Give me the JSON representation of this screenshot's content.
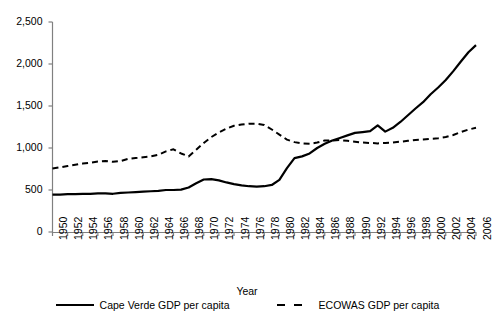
{
  "chart_data": {
    "type": "line",
    "title": "",
    "xlabel": "Year",
    "ylabel": "",
    "xlim": [
      1950,
      2006
    ],
    "ylim": [
      0,
      2500
    ],
    "grid": false,
    "legend_position": "bottom",
    "x_tick_labels": [
      "1950",
      "1952",
      "1954",
      "1956",
      "1958",
      "1960",
      "1962",
      "1964",
      "1966",
      "1968",
      "1970",
      "1972",
      "1974",
      "1976",
      "1978",
      "1980",
      "1982",
      "1984",
      "1986",
      "1988",
      "1990",
      "1992",
      "1994",
      "1996",
      "1998",
      "2000",
      "2002",
      "2004",
      "2006"
    ],
    "y_tick_labels": [
      "0",
      "500",
      "1,000",
      "1,500",
      "2,000",
      "2,500"
    ],
    "y_tick_values": [
      0,
      500,
      1000,
      1500,
      2000,
      2500
    ],
    "x": [
      1950,
      1951,
      1952,
      1953,
      1954,
      1955,
      1956,
      1957,
      1958,
      1959,
      1960,
      1961,
      1962,
      1963,
      1964,
      1965,
      1966,
      1967,
      1968,
      1969,
      1970,
      1971,
      1972,
      1973,
      1974,
      1975,
      1976,
      1977,
      1978,
      1979,
      1980,
      1981,
      1982,
      1983,
      1984,
      1985,
      1986,
      1987,
      1988,
      1989,
      1990,
      1991,
      1992,
      1993,
      1994,
      1995,
      1996,
      1997,
      1998,
      1999,
      2000,
      2001,
      2002,
      2003,
      2004,
      2005,
      2006
    ],
    "series": [
      {
        "name": "Cape Verde GDP per capita",
        "style": "solid",
        "color": "#000000",
        "values": [
          445,
          445,
          450,
          450,
          455,
          455,
          460,
          460,
          455,
          465,
          470,
          475,
          480,
          485,
          490,
          500,
          500,
          505,
          530,
          580,
          625,
          630,
          615,
          590,
          570,
          555,
          545,
          540,
          545,
          560,
          620,
          760,
          880,
          900,
          935,
          1000,
          1050,
          1090,
          1120,
          1150,
          1180,
          1190,
          1200,
          1270,
          1195,
          1240,
          1310,
          1390,
          1470,
          1545,
          1640,
          1720,
          1810,
          1915,
          2030,
          2140,
          2225
        ]
      },
      {
        "name": "ECOWAS GDP per capita",
        "style": "dashed",
        "color": "#000000",
        "values": [
          755,
          770,
          785,
          800,
          815,
          825,
          840,
          845,
          835,
          845,
          870,
          880,
          890,
          900,
          920,
          960,
          985,
          935,
          900,
          980,
          1060,
          1130,
          1185,
          1230,
          1265,
          1280,
          1290,
          1290,
          1275,
          1220,
          1160,
          1100,
          1070,
          1055,
          1050,
          1065,
          1090,
          1090,
          1095,
          1085,
          1075,
          1065,
          1060,
          1055,
          1060,
          1065,
          1075,
          1085,
          1095,
          1100,
          1110,
          1115,
          1130,
          1155,
          1190,
          1220,
          1240
        ]
      }
    ]
  },
  "legend": {
    "items": [
      {
        "label": "Cape Verde GDP per capita",
        "style": "solid"
      },
      {
        "label": "ECOWAS GDP per capita",
        "style": "dashed"
      }
    ]
  },
  "axis": {
    "x_title": "Year"
  }
}
